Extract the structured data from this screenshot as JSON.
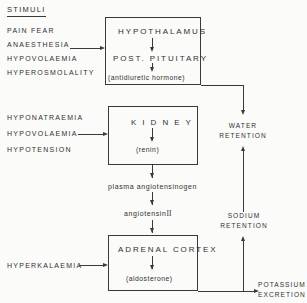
{
  "diagram": {
    "stimuli_heading": "STIMULI",
    "adh_stimuli": [
      "PAIN   FEAR",
      "ANAESTHESIA",
      "HYPOVOLAEMIA",
      "HYPEROSMOLALITY"
    ],
    "renin_stimuli": [
      "HYPONATRAEMIA",
      "HYPOVOLAEMIA",
      "HYPOTENSION"
    ],
    "aldosterone_stimuli": [
      "HYPERKALAEMIA"
    ],
    "boxes": {
      "hypothalamus": {
        "title": "HYPOTHALAMUS",
        "subtitle": "POST. PITUITARY",
        "product": "(antidiuretic   hormone)"
      },
      "kidney": {
        "title": "K I D N E Y",
        "product": "(renin)"
      },
      "adrenal": {
        "title": "ADRENAL   CORTEX",
        "product": "(aldosterone)"
      }
    },
    "intermediates": {
      "angiotensinogen": "plasma  angiotensinogen",
      "angiotensin": "angiotensin",
      "angiotensin_numeral": "II"
    },
    "outcomes": {
      "water_retention": "WATER\nRETENTION",
      "sodium_retention": "SODIUM\nRETENTION",
      "potassium_excretion": "POTASSIUM\nEXCRETION"
    },
    "colors": {
      "ink": "#3a3a38",
      "paper": "#fbfbfa"
    }
  }
}
